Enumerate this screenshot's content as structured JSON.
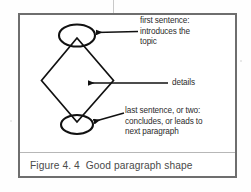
{
  "figure": {
    "caption": "Figure 4. 4  Good paragraph shape",
    "frame_color": "#6e6e6e",
    "ink_color": "#111111",
    "text_color": "#2b2b2b",
    "caption_color": "#4a4a4a",
    "background": "#ffffff"
  },
  "diagram": {
    "type": "paragraph-shape-diagram",
    "shape": "diamond",
    "top_marker": "ellipse",
    "bottom_marker": "ellipse",
    "annotations": [
      {
        "id": "first-sentence",
        "text": "first sentence:\nintroduces the\ntopic",
        "target": "top-ellipse",
        "arrow_direction": "left"
      },
      {
        "id": "details",
        "text": "details",
        "target": "diamond-middle",
        "arrow_direction": "left"
      },
      {
        "id": "last-sentence",
        "text": "last sentence, or two:\nconcludes, or leads to\nnext paragraph",
        "target": "bottom-ellipse",
        "arrow_direction": "left"
      }
    ]
  },
  "icons": {
    "arrow": "arrow-left-icon"
  }
}
